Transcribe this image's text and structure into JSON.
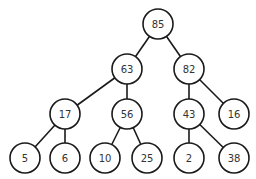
{
  "diagram": {
    "type": "binary-tree",
    "node_radius": 15,
    "colors": {
      "stroke": "#1a1a1a",
      "fill": "#ffffff",
      "text": "#333333"
    },
    "nodes": [
      {
        "id": "n85",
        "label": "85",
        "x": 158,
        "y": 24
      },
      {
        "id": "n63",
        "label": "63",
        "x": 127,
        "y": 69
      },
      {
        "id": "n82",
        "label": "82",
        "x": 189,
        "y": 69
      },
      {
        "id": "n17",
        "label": "17",
        "x": 65,
        "y": 114
      },
      {
        "id": "n56",
        "label": "56",
        "x": 127,
        "y": 114
      },
      {
        "id": "n43",
        "label": "43",
        "x": 189,
        "y": 114
      },
      {
        "id": "n16",
        "label": "16",
        "x": 234,
        "y": 114
      },
      {
        "id": "n5",
        "label": "5",
        "x": 25,
        "y": 158
      },
      {
        "id": "n6",
        "label": "6",
        "x": 65,
        "y": 158
      },
      {
        "id": "n10",
        "label": "10",
        "x": 105,
        "y": 158
      },
      {
        "id": "n25",
        "label": "25",
        "x": 147,
        "y": 158
      },
      {
        "id": "n2",
        "label": "2",
        "x": 189,
        "y": 158
      },
      {
        "id": "n38",
        "label": "38",
        "x": 234,
        "y": 158
      }
    ],
    "edges": [
      [
        "n85",
        "n63"
      ],
      [
        "n85",
        "n82"
      ],
      [
        "n63",
        "n17"
      ],
      [
        "n63",
        "n56"
      ],
      [
        "n82",
        "n43"
      ],
      [
        "n82",
        "n16"
      ],
      [
        "n17",
        "n5"
      ],
      [
        "n17",
        "n6"
      ],
      [
        "n56",
        "n10"
      ],
      [
        "n56",
        "n25"
      ],
      [
        "n43",
        "n2"
      ],
      [
        "n43",
        "n38"
      ]
    ]
  }
}
